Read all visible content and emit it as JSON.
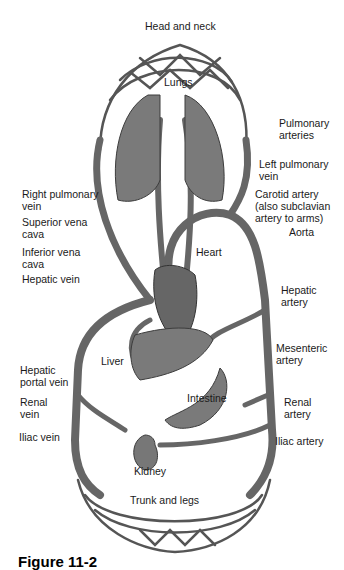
{
  "figure": {
    "caption": "Figure 11-2",
    "colors": {
      "vessel": "#6b6b6b",
      "vessel_edge": "#3c3c3c",
      "organ": "#7a7a7a",
      "organ_dark": "#4a4a4a",
      "background": "#ffffff",
      "text": "#1a1a1a"
    }
  },
  "labels": {
    "head_neck": "Head and neck",
    "lungs": "Lungs",
    "pulmonary_arteries": "Pulmonary\narteries",
    "left_pulmonary_vein": "Left pulmonary\nvein",
    "right_pulmonary_vein": "Right pulmonary\nvein",
    "carotid_artery": "Carotid artery\n(also subclavian\nartery to arms)",
    "superior_vena_cava": "Superior vena\ncava",
    "aorta": "Aorta",
    "inferior_vena_cava": "Inferior vena\ncava",
    "heart": "Heart",
    "hepatic_vein": "Hepatic vein",
    "hepatic_artery": "Hepatic\nartery",
    "mesenteric_artery": "Mesenteric\nartery",
    "liver": "Liver",
    "hepatic_portal_vein": "Hepatic\nportal vein",
    "intestine": "Intestine",
    "renal_vein": "Renal\nvein",
    "renal_artery": "Renal\nartery",
    "iliac_vein": "Iliac vein",
    "iliac_artery": "Iliac artery",
    "kidney": "Kidney",
    "trunk_legs": "Trunk and legs"
  }
}
